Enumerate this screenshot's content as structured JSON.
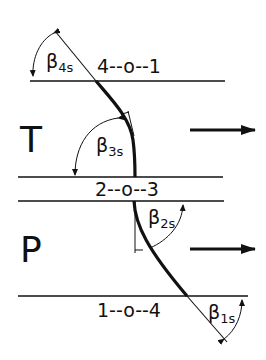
{
  "diagram": {
    "type": "turbomachine-velocity-stage-blade-profile",
    "rows": [
      {
        "id": "T",
        "label": "T",
        "flow_arrow": "right"
      },
      {
        "id": "P",
        "label": "P",
        "flow_arrow": "right"
      }
    ],
    "stations": {
      "top": "4--o--1",
      "middle": "2--o--3",
      "bottom": "1--o--4"
    },
    "angles": [
      {
        "id": "beta4s",
        "symbol": "β",
        "sub": "4s"
      },
      {
        "id": "beta3s",
        "symbol": "β",
        "sub": "3s"
      },
      {
        "id": "beta2s",
        "symbol": "β",
        "sub": "2s"
      },
      {
        "id": "beta1s",
        "symbol": "β",
        "sub": "1s"
      }
    ],
    "colors": {
      "ink": "#111111",
      "background": "#ffffff"
    }
  }
}
